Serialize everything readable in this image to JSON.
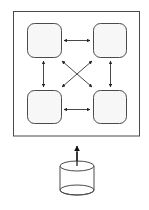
{
  "diagram": {
    "type": "architecture",
    "colors": {
      "stroke": "#4a4a4a",
      "node_fill": "#f7f7f7",
      "background": "#ffffff",
      "arrow": "#222222"
    },
    "container": {
      "x": 13,
      "y": 11,
      "w": 127,
      "h": 125,
      "label": ""
    },
    "nodes": [
      {
        "id": "node-top-left",
        "x": 27,
        "y": 23,
        "w": 35,
        "h": 35,
        "label": ""
      },
      {
        "id": "node-top-right",
        "x": 93,
        "y": 23,
        "w": 34,
        "h": 35,
        "label": ""
      },
      {
        "id": "node-bottom-left",
        "x": 27,
        "y": 90,
        "w": 35,
        "h": 34,
        "label": ""
      },
      {
        "id": "node-bottom-right",
        "x": 93,
        "y": 90,
        "w": 34,
        "h": 34,
        "label": ""
      }
    ],
    "edges": [
      {
        "from": "node-top-left",
        "to": "node-top-right",
        "bidirectional": true
      },
      {
        "from": "node-bottom-left",
        "to": "node-bottom-right",
        "bidirectional": true
      },
      {
        "from": "node-top-left",
        "to": "node-bottom-left",
        "bidirectional": true
      },
      {
        "from": "node-top-right",
        "to": "node-bottom-right",
        "bidirectional": true
      },
      {
        "from": "node-top-left",
        "to": "node-bottom-right",
        "bidirectional": true
      },
      {
        "from": "node-top-right",
        "to": "node-bottom-left",
        "bidirectional": true
      },
      {
        "from": "database",
        "to": "container",
        "bidirectional": false
      }
    ],
    "database": {
      "cx": 77,
      "top_y": 166,
      "bottom_y": 190,
      "rx": 17,
      "ry": 5,
      "label": ""
    }
  }
}
